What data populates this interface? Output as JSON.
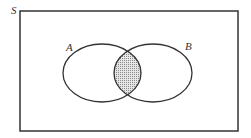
{
  "diagram": {
    "type": "venn",
    "universe_label": "S",
    "sets": [
      {
        "label": "A"
      },
      {
        "label": "B"
      }
    ],
    "shaded_region": "A ∩ B",
    "colors": {
      "stroke": "#333333",
      "shade": "#b8b8b8",
      "background": "#ffffff"
    }
  }
}
